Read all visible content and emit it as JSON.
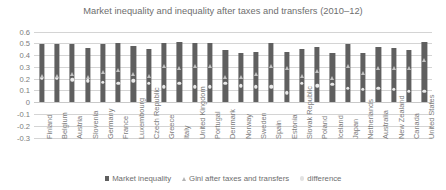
{
  "chart_data": {
    "type": "bar",
    "title": "Market inequality and inequality after taxes and transfers (2010–12)",
    "xlabel": "",
    "ylabel": "",
    "ylim": [
      -0.3,
      0.6
    ],
    "ytick_step": 0.1,
    "grid": true,
    "legend_position": "bottom",
    "yticks": [
      "0.6",
      "0.5",
      "0.4",
      "0.3",
      "0.2",
      "0.1",
      "0",
      "-0.1",
      "-0.2",
      "-0.3"
    ],
    "categories": [
      "Finland",
      "Belgium",
      "Austria",
      "Slovenia",
      "Germany",
      "France",
      "Luxembourg",
      "Czech Republic",
      "Greece",
      "Italy",
      "United Kingdom",
      "Portugal",
      "Denmark",
      "Norway",
      "Sweden",
      "Spain",
      "Estonia",
      "Slovak Republic",
      "Poland",
      "Iceland",
      "Japan",
      "Netherlands",
      "Australia",
      "New Zealand",
      "Canada",
      "United States"
    ],
    "series": [
      {
        "name": "Market inequality",
        "marker": "square",
        "color": "#5f5f5f",
        "values": [
          0.49,
          0.49,
          0.49,
          0.46,
          0.49,
          0.5,
          0.48,
          0.45,
          0.5,
          0.51,
          0.5,
          0.5,
          0.44,
          0.42,
          0.43,
          0.5,
          0.43,
          0.45,
          0.47,
          0.42,
          0.49,
          0.42,
          0.47,
          0.46,
          0.44,
          0.51
        ]
      },
      {
        "name": "Gini after taxes and transfers",
        "marker": "triangle",
        "color": "#c2c2c2",
        "values": [
          0.26,
          0.26,
          0.27,
          0.25,
          0.29,
          0.31,
          0.27,
          0.26,
          0.34,
          0.32,
          0.34,
          0.34,
          0.25,
          0.25,
          0.27,
          0.34,
          0.32,
          0.26,
          0.3,
          0.24,
          0.34,
          0.28,
          0.32,
          0.32,
          0.32,
          0.39
        ]
      },
      {
        "name": "difference",
        "marker": "circle",
        "color": "#ebebeb",
        "values": [
          0.23,
          0.23,
          0.22,
          0.21,
          0.2,
          0.19,
          0.21,
          0.19,
          0.16,
          0.19,
          0.16,
          0.16,
          0.19,
          0.17,
          0.16,
          0.16,
          0.11,
          0.19,
          0.17,
          0.18,
          0.15,
          0.14,
          0.15,
          0.14,
          0.12,
          0.12
        ]
      }
    ]
  },
  "legend": {
    "items": [
      {
        "label": "Market inequality"
      },
      {
        "label": "Gini after taxes and transfers"
      },
      {
        "label": "difference"
      }
    ]
  }
}
